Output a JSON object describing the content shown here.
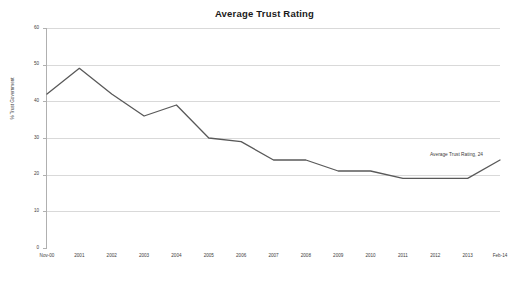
{
  "chart_data": {
    "type": "line",
    "title": "Average Trust Rating",
    "xlabel": "",
    "ylabel": "% Trust Government",
    "categories": [
      "Nov-00",
      "2001",
      "2002",
      "2003",
      "2004",
      "2005",
      "2006",
      "2007",
      "2008",
      "2009",
      "2010",
      "2011",
      "2012",
      "2013",
      "Feb-14"
    ],
    "values": [
      42,
      49,
      42,
      36,
      39,
      30,
      29,
      24,
      24,
      21,
      21,
      19,
      19,
      19,
      24
    ],
    "series": [
      {
        "name": "Average Trust Rating",
        "values": [
          42,
          49,
          42,
          36,
          39,
          30,
          29,
          24,
          24,
          21,
          21,
          19,
          19,
          19,
          24
        ]
      }
    ],
    "ylim": [
      0,
      60
    ],
    "y_ticks": [
      0,
      10,
      20,
      30,
      40,
      50,
      60
    ],
    "y_tick_labels": [
      "0",
      "10",
      "20",
      "30",
      "40",
      "50",
      "60"
    ],
    "grid": true,
    "legend": false,
    "legend_position": "none",
    "annotations": [
      {
        "text": "Average Trust Rating, 24",
        "category": "Feb-14",
        "value": 24
      }
    ],
    "line_color": "#595959",
    "grid_color": "#d9d9d9",
    "axis_color": "#b0b0b0",
    "background_color": "#ffffff",
    "text_color": "#3d3d3d"
  }
}
